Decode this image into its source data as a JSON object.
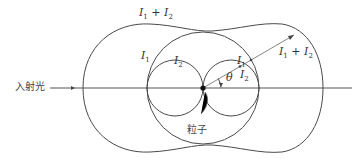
{
  "figure": {
    "incident_light_label": "入射光",
    "particle_label": "粒子",
    "angle_label": "θ",
    "labels": {
      "outer_top": {
        "base": "I",
        "sub1": "1",
        "plus": " + ",
        "base2": "I",
        "sub2": "2"
      },
      "outer_ray": {
        "base": "I",
        "sub1": "1",
        "plus": " + ",
        "base2": "I",
        "sub2": "2"
      },
      "middle_left": {
        "base": "I",
        "sub": "1"
      },
      "lobe_left": {
        "base": "I",
        "sub": "2"
      },
      "middle_ray": {
        "base": "I",
        "sub": "1"
      },
      "lobe_ray": {
        "base": "I",
        "sub": "2"
      }
    },
    "colors": {
      "stroke": "#4a4a4a",
      "background": "#ffffff"
    }
  }
}
